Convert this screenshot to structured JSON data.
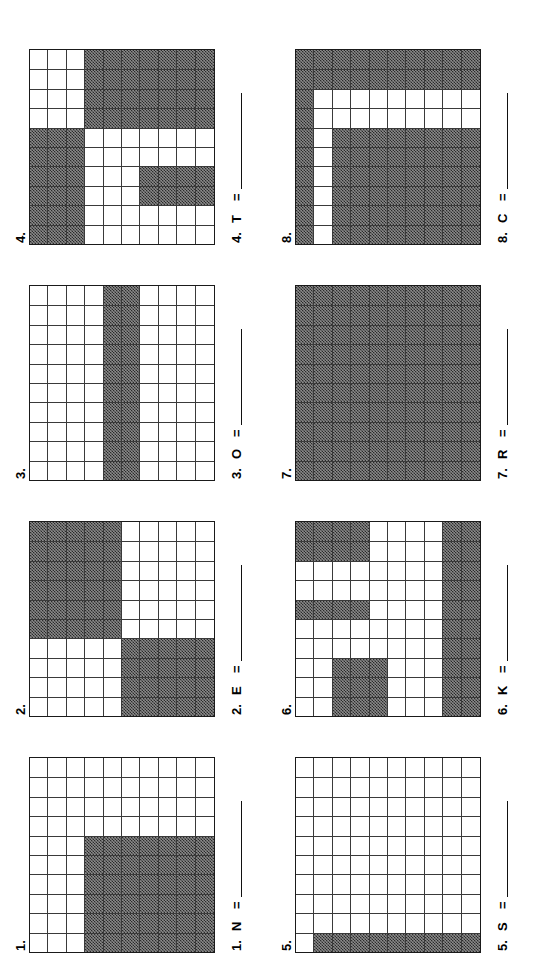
{
  "worksheet": {
    "title": "Shade the grids",
    "grid_size": {
      "cols": 10,
      "rows": 10
    },
    "fill_color": "#555555",
    "line_color": "#333333"
  },
  "problems": [
    {
      "number": "1.",
      "answer_number": "1.",
      "letter": "N",
      "equals": "=",
      "answer_value": "",
      "filled_cells": 42,
      "shaded": [
        [
          0,
          0,
          0,
          0,
          0,
          0,
          0,
          0,
          0,
          0
        ],
        [
          0,
          0,
          0,
          0,
          0,
          0,
          0,
          0,
          0,
          0
        ],
        [
          0,
          0,
          0,
          0,
          0,
          0,
          0,
          0,
          0,
          0
        ],
        [
          1,
          1,
          1,
          1,
          1,
          1,
          0,
          0,
          0,
          0
        ],
        [
          1,
          1,
          1,
          1,
          1,
          1,
          0,
          0,
          0,
          0
        ],
        [
          1,
          1,
          1,
          1,
          1,
          1,
          0,
          0,
          0,
          0
        ],
        [
          1,
          1,
          1,
          1,
          1,
          1,
          0,
          0,
          0,
          0
        ],
        [
          1,
          1,
          1,
          1,
          1,
          1,
          0,
          0,
          0,
          0
        ],
        [
          1,
          1,
          1,
          1,
          1,
          1,
          0,
          0,
          0,
          0
        ],
        [
          1,
          1,
          1,
          1,
          1,
          1,
          0,
          0,
          0,
          0
        ]
      ]
    },
    {
      "number": "2.",
      "answer_number": "2.",
      "letter": "E",
      "equals": "=",
      "answer_value": "",
      "filled_cells": 50,
      "shaded": [
        [
          0,
          0,
          0,
          0,
          1,
          1,
          1,
          1,
          1,
          1
        ],
        [
          0,
          0,
          0,
          0,
          1,
          1,
          1,
          1,
          1,
          1
        ],
        [
          0,
          0,
          0,
          0,
          1,
          1,
          1,
          1,
          1,
          1
        ],
        [
          0,
          0,
          0,
          0,
          1,
          1,
          1,
          1,
          1,
          1
        ],
        [
          0,
          0,
          0,
          0,
          1,
          1,
          1,
          1,
          1,
          1
        ],
        [
          1,
          1,
          1,
          1,
          0,
          0,
          0,
          0,
          0,
          0
        ],
        [
          1,
          1,
          1,
          1,
          0,
          0,
          0,
          0,
          0,
          0
        ],
        [
          1,
          1,
          1,
          1,
          0,
          0,
          0,
          0,
          0,
          0
        ],
        [
          1,
          1,
          1,
          1,
          0,
          0,
          0,
          0,
          0,
          0
        ],
        [
          1,
          1,
          1,
          1,
          0,
          0,
          0,
          0,
          0,
          0
        ]
      ]
    },
    {
      "number": "3.",
      "answer_number": "3.",
      "letter": "O",
      "equals": "=",
      "answer_value": "",
      "filled_cells": 20,
      "shaded": [
        [
          0,
          0,
          0,
          0,
          0,
          0,
          0,
          0,
          0,
          0
        ],
        [
          0,
          0,
          0,
          0,
          0,
          0,
          0,
          0,
          0,
          0
        ],
        [
          0,
          0,
          0,
          0,
          0,
          0,
          0,
          0,
          0,
          0
        ],
        [
          0,
          0,
          0,
          0,
          0,
          0,
          0,
          0,
          0,
          0
        ],
        [
          1,
          1,
          1,
          1,
          1,
          1,
          1,
          1,
          1,
          1
        ],
        [
          1,
          1,
          1,
          1,
          1,
          1,
          1,
          1,
          1,
          1
        ],
        [
          0,
          0,
          0,
          0,
          0,
          0,
          0,
          0,
          0,
          0
        ],
        [
          0,
          0,
          0,
          0,
          0,
          0,
          0,
          0,
          0,
          0
        ],
        [
          0,
          0,
          0,
          0,
          0,
          0,
          0,
          0,
          0,
          0
        ],
        [
          0,
          0,
          0,
          0,
          0,
          0,
          0,
          0,
          0,
          0
        ]
      ]
    },
    {
      "number": "4.",
      "answer_number": "4.",
      "letter": "T",
      "equals": "=",
      "answer_value": "",
      "filled_cells": 56,
      "shaded": [
        [
          1,
          1,
          1,
          1,
          1,
          1,
          0,
          0,
          0,
          0
        ],
        [
          1,
          1,
          1,
          1,
          1,
          1,
          0,
          0,
          0,
          0
        ],
        [
          1,
          1,
          1,
          1,
          1,
          1,
          0,
          0,
          0,
          0
        ],
        [
          0,
          0,
          0,
          0,
          0,
          0,
          1,
          1,
          1,
          1
        ],
        [
          0,
          0,
          0,
          0,
          0,
          0,
          1,
          1,
          1,
          1
        ],
        [
          0,
          0,
          0,
          0,
          0,
          0,
          1,
          1,
          1,
          1
        ],
        [
          0,
          0,
          1,
          1,
          0,
          0,
          1,
          1,
          1,
          1
        ],
        [
          0,
          0,
          1,
          1,
          0,
          0,
          1,
          1,
          1,
          1
        ],
        [
          0,
          0,
          1,
          1,
          0,
          0,
          1,
          1,
          1,
          1
        ],
        [
          0,
          0,
          1,
          1,
          0,
          0,
          1,
          1,
          1,
          1
        ]
      ]
    },
    {
      "number": "5.",
      "answer_number": "5.",
      "letter": "S",
      "equals": "=",
      "answer_value": "",
      "filled_cells": 9,
      "shaded": [
        [
          0,
          0,
          0,
          0,
          0,
          0,
          0,
          0,
          0,
          0
        ],
        [
          1,
          0,
          0,
          0,
          0,
          0,
          0,
          0,
          0,
          0
        ],
        [
          1,
          0,
          0,
          0,
          0,
          0,
          0,
          0,
          0,
          0
        ],
        [
          1,
          0,
          0,
          0,
          0,
          0,
          0,
          0,
          0,
          0
        ],
        [
          1,
          0,
          0,
          0,
          0,
          0,
          0,
          0,
          0,
          0
        ],
        [
          1,
          0,
          0,
          0,
          0,
          0,
          0,
          0,
          0,
          0
        ],
        [
          1,
          0,
          0,
          0,
          0,
          0,
          0,
          0,
          0,
          0
        ],
        [
          1,
          0,
          0,
          0,
          0,
          0,
          0,
          0,
          0,
          0
        ],
        [
          1,
          0,
          0,
          0,
          0,
          0,
          0,
          0,
          0,
          0
        ],
        [
          1,
          0,
          0,
          0,
          0,
          0,
          0,
          0,
          0,
          0
        ]
      ]
    },
    {
      "number": "6.",
      "answer_number": "6.",
      "letter": "K",
      "equals": "=",
      "answer_value": "",
      "filled_cells": 36,
      "shaded": [
        [
          0,
          0,
          0,
          0,
          0,
          1,
          0,
          0,
          1,
          1
        ],
        [
          0,
          0,
          0,
          0,
          0,
          1,
          0,
          0,
          1,
          1
        ],
        [
          1,
          1,
          1,
          0,
          0,
          1,
          0,
          0,
          1,
          1
        ],
        [
          1,
          1,
          1,
          0,
          0,
          1,
          0,
          0,
          1,
          1
        ],
        [
          1,
          1,
          1,
          0,
          0,
          0,
          0,
          0,
          0,
          0
        ],
        [
          0,
          0,
          0,
          0,
          0,
          0,
          0,
          0,
          0,
          0
        ],
        [
          0,
          0,
          0,
          0,
          0,
          0,
          0,
          0,
          0,
          0
        ],
        [
          0,
          0,
          0,
          0,
          0,
          0,
          0,
          0,
          0,
          0
        ],
        [
          1,
          1,
          1,
          1,
          1,
          1,
          1,
          1,
          1,
          1
        ],
        [
          1,
          1,
          1,
          1,
          1,
          1,
          1,
          1,
          1,
          1
        ]
      ]
    },
    {
      "number": "7.",
      "answer_number": "7.",
      "letter": "R",
      "equals": "=",
      "answer_value": "",
      "filled_cells": 100,
      "shaded": [
        [
          1,
          1,
          1,
          1,
          1,
          1,
          1,
          1,
          1,
          1
        ],
        [
          1,
          1,
          1,
          1,
          1,
          1,
          1,
          1,
          1,
          1
        ],
        [
          1,
          1,
          1,
          1,
          1,
          1,
          1,
          1,
          1,
          1
        ],
        [
          1,
          1,
          1,
          1,
          1,
          1,
          1,
          1,
          1,
          1
        ],
        [
          1,
          1,
          1,
          1,
          1,
          1,
          1,
          1,
          1,
          1
        ],
        [
          1,
          1,
          1,
          1,
          1,
          1,
          1,
          1,
          1,
          1
        ],
        [
          1,
          1,
          1,
          1,
          1,
          1,
          1,
          1,
          1,
          1
        ],
        [
          1,
          1,
          1,
          1,
          1,
          1,
          1,
          1,
          1,
          1
        ],
        [
          1,
          1,
          1,
          1,
          1,
          1,
          1,
          1,
          1,
          1
        ],
        [
          1,
          1,
          1,
          1,
          1,
          1,
          1,
          1,
          1,
          1
        ]
      ]
    },
    {
      "number": "8.",
      "answer_number": "8.",
      "letter": "C",
      "equals": "=",
      "answer_value": "",
      "filled_cells": 84,
      "shaded": [
        [
          1,
          1,
          1,
          1,
          1,
          1,
          1,
          1,
          1,
          1
        ],
        [
          0,
          0,
          0,
          0,
          0,
          0,
          0,
          0,
          1,
          1
        ],
        [
          1,
          1,
          1,
          1,
          1,
          1,
          0,
          0,
          1,
          1
        ],
        [
          1,
          1,
          1,
          1,
          1,
          1,
          0,
          0,
          1,
          1
        ],
        [
          1,
          1,
          1,
          1,
          1,
          1,
          0,
          0,
          1,
          1
        ],
        [
          1,
          1,
          1,
          1,
          1,
          1,
          0,
          0,
          1,
          1
        ],
        [
          1,
          1,
          1,
          1,
          1,
          1,
          0,
          0,
          1,
          1
        ],
        [
          1,
          1,
          1,
          1,
          1,
          1,
          0,
          0,
          1,
          1
        ],
        [
          1,
          1,
          1,
          1,
          1,
          1,
          0,
          0,
          1,
          1
        ],
        [
          1,
          1,
          1,
          1,
          1,
          1,
          0,
          0,
          1,
          1
        ]
      ]
    }
  ]
}
